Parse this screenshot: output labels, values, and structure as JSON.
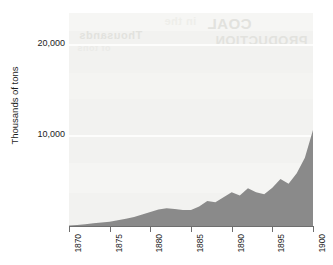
{
  "chart_data": {
    "type": "area",
    "title": "",
    "subtitle": "",
    "xlabel": "",
    "ylabel": "Thousands of tons",
    "xlim": [
      1870,
      1900
    ],
    "ylim": [
      0,
      23400
    ],
    "grid": true,
    "legend_position": "none",
    "x_tick_labels": [
      "1870",
      "1875",
      "1880",
      "1885",
      "1890",
      "1895",
      "1900"
    ],
    "x_ticks": [
      1870,
      1875,
      1880,
      1885,
      1890,
      1895,
      1900
    ],
    "y_tick_labels": [
      "10,000",
      "20,000"
    ],
    "y_ticks": [
      10000,
      20000
    ],
    "series": [
      {
        "name": "Thousands of tons",
        "color": "#8a8a8a",
        "x": [
          1870,
          1871,
          1872,
          1873,
          1874,
          1875,
          1876,
          1877,
          1878,
          1879,
          1880,
          1881,
          1882,
          1883,
          1884,
          1885,
          1886,
          1887,
          1888,
          1889,
          1890,
          1891,
          1892,
          1893,
          1894,
          1895,
          1896,
          1897,
          1898,
          1899,
          1900
        ],
        "values": [
          60,
          120,
          200,
          300,
          380,
          480,
          620,
          800,
          1000,
          1250,
          1550,
          1820,
          1950,
          1880,
          1760,
          1750,
          2150,
          2750,
          2600,
          3150,
          3700,
          3350,
          4150,
          3700,
          3500,
          4200,
          5150,
          4650,
          5800,
          7500,
          10550
        ]
      }
    ],
    "annotations": []
  },
  "axes": {
    "y_title": "Thousands of tons",
    "y_labels": [
      {
        "text": "20,000",
        "value": 20000
      },
      {
        "text": "10,000",
        "value": 10000
      }
    ],
    "x_labels": [
      {
        "text": "1870",
        "value": 1870
      },
      {
        "text": "1875",
        "value": 1875
      },
      {
        "text": "1880",
        "value": 1880
      },
      {
        "text": "1885",
        "value": 1885
      },
      {
        "text": "1890",
        "value": 1890
      },
      {
        "text": "1895",
        "value": 1895
      },
      {
        "text": "1900",
        "value": 1900
      }
    ]
  },
  "style": {
    "plot_background": "#f2f2f0",
    "series_fill": "#8a8a8a",
    "gridline_color": "#fdfdfc",
    "axis_color": "#6e6e6e",
    "text_color": "#1c1c1c",
    "page_background": "#ffffff"
  },
  "bleed_through": {
    "note": "faint mirrored text showing through from the reverse of the scanned page",
    "fragments": [
      "COAL",
      "PRODUCTION",
      "Thousands",
      "of tons",
      "in the"
    ]
  }
}
